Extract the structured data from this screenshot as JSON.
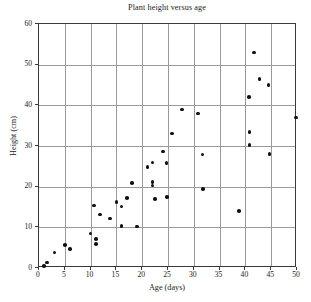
{
  "chart_data": {
    "type": "scatter",
    "title": "Plant height versus age",
    "xlabel": "Age (days)",
    "ylabel": "Height (cm)",
    "xlim": [
      0,
      50
    ],
    "ylim": [
      0,
      60
    ],
    "grid": true,
    "legend": null,
    "marker": {
      "shape": "circle",
      "color": "#111111",
      "size_px": 3.6
    },
    "xticks": [
      0,
      5,
      10,
      15,
      20,
      25,
      30,
      35,
      40,
      45,
      50
    ],
    "yticks": [
      0,
      10,
      20,
      30,
      40,
      50,
      60
    ],
    "series": [
      {
        "name": "Plant height",
        "points": [
          {
            "x": 1.0,
            "y": 0.5
          },
          {
            "x": 1.5,
            "y": 1.4
          },
          {
            "x": 3.0,
            "y": 3.8
          },
          {
            "x": 5.0,
            "y": 5.7
          },
          {
            "x": 6.0,
            "y": 4.7
          },
          {
            "x": 10.0,
            "y": 8.5
          },
          {
            "x": 10.7,
            "y": 15.4
          },
          {
            "x": 11.0,
            "y": 7.2
          },
          {
            "x": 11.0,
            "y": 5.9
          },
          {
            "x": 11.8,
            "y": 13.2
          },
          {
            "x": 13.8,
            "y": 12.2
          },
          {
            "x": 15.0,
            "y": 16.3
          },
          {
            "x": 16.0,
            "y": 15.1
          },
          {
            "x": 16.0,
            "y": 10.3
          },
          {
            "x": 17.0,
            "y": 17.2
          },
          {
            "x": 18.0,
            "y": 20.9
          },
          {
            "x": 19.0,
            "y": 10.2
          },
          {
            "x": 21.0,
            "y": 24.9
          },
          {
            "x": 22.0,
            "y": 25.9
          },
          {
            "x": 22.0,
            "y": 21.2
          },
          {
            "x": 22.0,
            "y": 20.3
          },
          {
            "x": 22.5,
            "y": 16.9
          },
          {
            "x": 24.0,
            "y": 28.6
          },
          {
            "x": 24.7,
            "y": 25.8
          },
          {
            "x": 24.8,
            "y": 17.5
          },
          {
            "x": 25.8,
            "y": 33.1
          },
          {
            "x": 27.7,
            "y": 39.0
          },
          {
            "x": 30.8,
            "y": 38.0
          },
          {
            "x": 31.7,
            "y": 27.9
          },
          {
            "x": 31.8,
            "y": 19.4
          },
          {
            "x": 38.8,
            "y": 14.0
          },
          {
            "x": 40.7,
            "y": 42.0
          },
          {
            "x": 40.8,
            "y": 33.4
          },
          {
            "x": 40.8,
            "y": 30.3
          },
          {
            "x": 41.7,
            "y": 53.0
          },
          {
            "x": 42.7,
            "y": 46.5
          },
          {
            "x": 44.5,
            "y": 45.0
          },
          {
            "x": 44.7,
            "y": 28.0
          },
          {
            "x": 49.8,
            "y": 37.0
          }
        ]
      }
    ]
  }
}
